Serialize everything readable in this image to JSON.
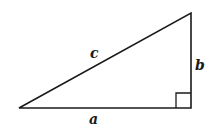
{
  "diagram": {
    "type": "right-triangle",
    "colors": {
      "stroke": "#1a1a1a",
      "background": "#ffffff",
      "label": "#1a1a1a"
    },
    "vertices": {
      "left": [
        19,
        108
      ],
      "right_angle": [
        191,
        108
      ],
      "top": [
        191,
        13
      ]
    },
    "right_angle_marker": {
      "size": 15
    },
    "labels": {
      "hypotenuse": "c",
      "vertical_leg": "b",
      "horizontal_leg": "a"
    }
  }
}
